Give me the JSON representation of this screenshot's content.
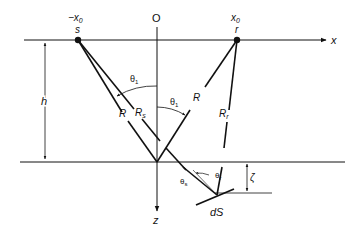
{
  "diagram": {
    "type": "reflection-geometry",
    "colors": {
      "ink": "#111111",
      "background": "#ffffff"
    },
    "labels": {
      "origin": "O",
      "x_axis": "x",
      "z_axis": "z",
      "source_coord": "−x",
      "source_coord_sub": "0",
      "source": "s",
      "receiver_coord": "x",
      "receiver_coord_sub": "0",
      "receiver": "r",
      "height": "h",
      "theta1_left": "θ",
      "theta1_left_sub": "1",
      "theta1_right": "θ",
      "theta1_right_sub": "1",
      "R_left": "R",
      "R_s": "R",
      "R_s_sub": "s",
      "R_right": "R",
      "R_r": "R",
      "R_r_sub": "r",
      "theta_s": "θ",
      "theta_s_sub": "s",
      "theta_r": "θ",
      "theta_r_sub": "r",
      "zeta": "ζ",
      "surface_element": "dS"
    },
    "points": {
      "source": [
        78,
        40
      ],
      "receiver": [
        237,
        40
      ],
      "image_point": [
        157,
        162
      ],
      "surface_element": [
        210,
        190
      ]
    }
  }
}
